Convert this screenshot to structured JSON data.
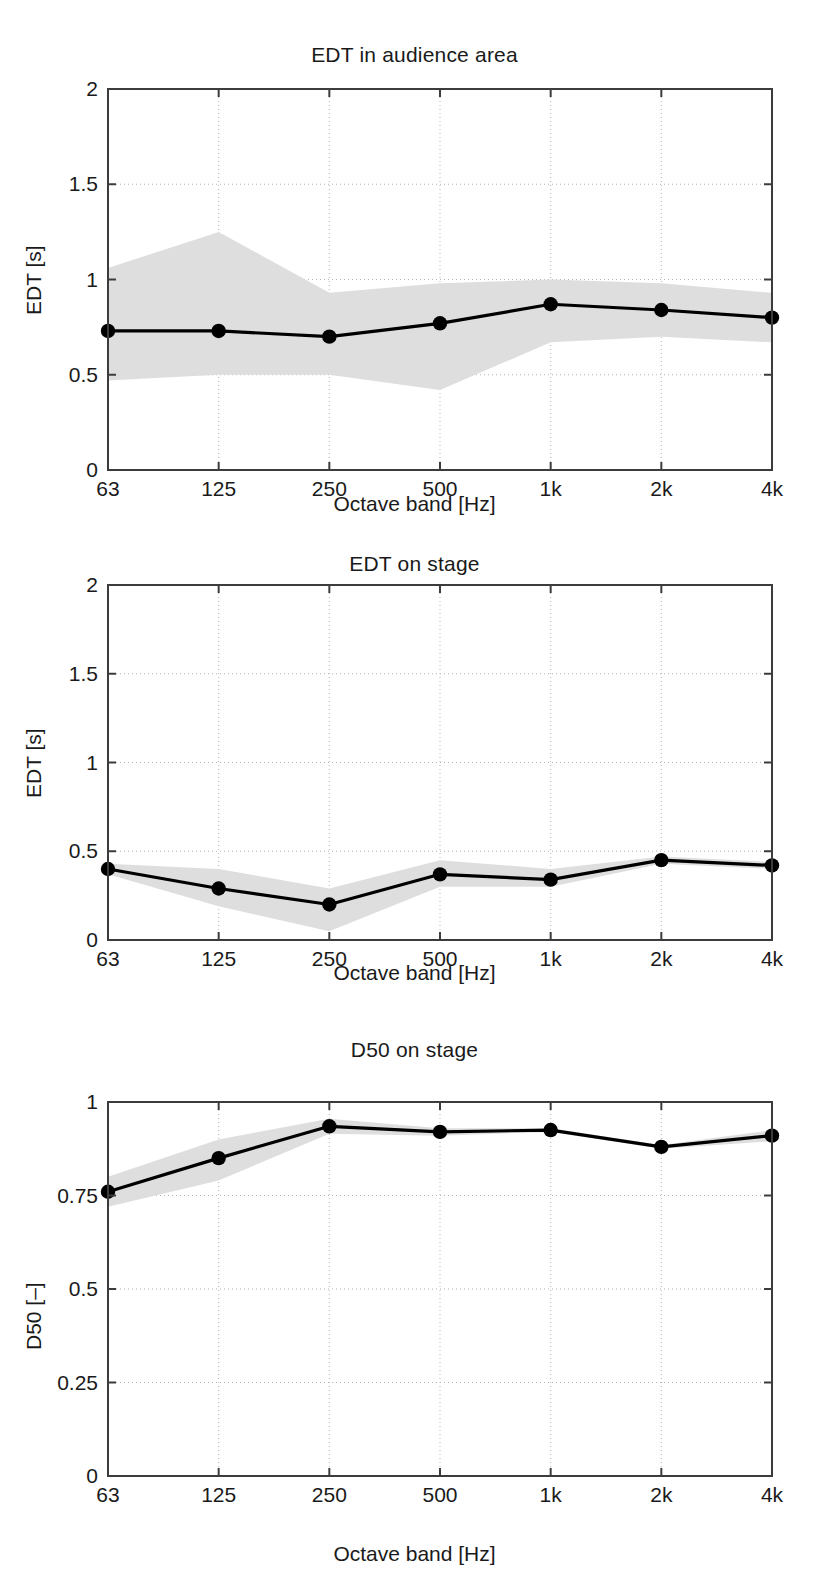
{
  "figure": {
    "background": "#ffffff",
    "line_color": "#000000",
    "band_color": "#dcdcdc",
    "grid_color": "#b4b4b4",
    "axis_color": "#3c3c3c",
    "marker_color": "#000000"
  },
  "common": {
    "xlabel": "Octave band [Hz]",
    "xticklabels": [
      "63",
      "125",
      "250",
      "500",
      "1k",
      "2k",
      "4k"
    ]
  },
  "chart_data": [
    {
      "type": "line",
      "id": "edt-audience",
      "title": "EDT in audience area",
      "xlabel": "Octave band [Hz]",
      "ylabel": "EDT [s]",
      "categories": [
        "63",
        "125",
        "250",
        "500",
        "1k",
        "2k",
        "4k"
      ],
      "x": [
        63,
        125,
        250,
        500,
        1000,
        2000,
        4000
      ],
      "ylim": [
        0,
        2
      ],
      "yticks": [
        0,
        0.5,
        1,
        1.5,
        2
      ],
      "yticklabels": [
        "0",
        "0.5",
        "1",
        "1.5",
        "2"
      ],
      "grid": true,
      "legend": null,
      "series": [
        {
          "name": "mean EDT",
          "values": [
            0.73,
            0.73,
            0.7,
            0.77,
            0.87,
            0.84,
            0.8
          ],
          "markers": "filled-circle"
        },
        {
          "name": "spread band upper",
          "values": [
            1.06,
            1.25,
            0.93,
            0.98,
            1.0,
            0.98,
            0.93
          ],
          "style": "band-edge"
        },
        {
          "name": "spread band lower",
          "values": [
            0.47,
            0.5,
            0.5,
            0.42,
            0.67,
            0.7,
            0.67
          ],
          "style": "band-edge"
        }
      ]
    },
    {
      "type": "line",
      "id": "edt-stage",
      "title": "EDT on stage",
      "xlabel": "Octave band [Hz]",
      "ylabel": "EDT [s]",
      "categories": [
        "63",
        "125",
        "250",
        "500",
        "1k",
        "2k",
        "4k"
      ],
      "x": [
        63,
        125,
        250,
        500,
        1000,
        2000,
        4000
      ],
      "ylim": [
        0,
        2
      ],
      "yticks": [
        0,
        0.5,
        1,
        1.5,
        2
      ],
      "yticklabels": [
        "0",
        "0.5",
        "1",
        "1.5",
        "2"
      ],
      "grid": true,
      "legend": null,
      "series": [
        {
          "name": "mean EDT",
          "values": [
            0.4,
            0.29,
            0.2,
            0.37,
            0.34,
            0.45,
            0.42
          ],
          "markers": "filled-circle"
        },
        {
          "name": "spread band upper",
          "values": [
            0.43,
            0.4,
            0.29,
            0.45,
            0.4,
            0.47,
            0.44
          ],
          "style": "band-edge"
        },
        {
          "name": "spread band lower",
          "values": [
            0.37,
            0.19,
            0.05,
            0.3,
            0.3,
            0.43,
            0.4
          ],
          "style": "band-edge"
        }
      ]
    },
    {
      "type": "line",
      "id": "d50-stage",
      "title": "D50 on stage",
      "xlabel": "Octave band [Hz]",
      "ylabel": "D50 [–]",
      "categories": [
        "63",
        "125",
        "250",
        "500",
        "1k",
        "2k",
        "4k"
      ],
      "x": [
        63,
        125,
        250,
        500,
        1000,
        2000,
        4000
      ],
      "ylim": [
        0,
        1
      ],
      "yticks": [
        0,
        0.25,
        0.5,
        0.75,
        1
      ],
      "yticklabels": [
        "0",
        "0.25",
        "0.5",
        "0.75",
        "1"
      ],
      "grid": true,
      "legend": null,
      "series": [
        {
          "name": "mean D50",
          "values": [
            0.76,
            0.85,
            0.935,
            0.92,
            0.925,
            0.88,
            0.91
          ],
          "markers": "filled-circle"
        },
        {
          "name": "spread band upper",
          "values": [
            0.8,
            0.9,
            0.955,
            0.93,
            0.93,
            0.885,
            0.925
          ],
          "style": "band-edge"
        },
        {
          "name": "spread band lower",
          "values": [
            0.72,
            0.79,
            0.915,
            0.91,
            0.92,
            0.875,
            0.895
          ]
        }
      ]
    }
  ]
}
